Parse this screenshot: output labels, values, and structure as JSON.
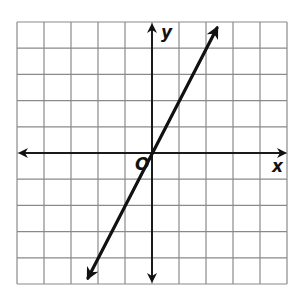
{
  "diagram": {
    "type": "coordinate-plane-graph",
    "axis_labels": {
      "x": "x",
      "y": "y",
      "origin": "O"
    },
    "grid": {
      "columns": 10,
      "rows": 10,
      "x_range": [
        -5,
        5
      ],
      "y_range": [
        -5,
        5
      ]
    },
    "line": {
      "equation": "y = 2x",
      "slope": 2,
      "intercept": 0,
      "arrows": "both",
      "endpoints": [
        [
          -2.5,
          -5
        ],
        [
          2.5,
          5
        ]
      ]
    },
    "colors": {
      "grid": "#8a8a8a",
      "axis": "#1a1a1a",
      "line": "#111111",
      "background": "#ffffff"
    }
  }
}
